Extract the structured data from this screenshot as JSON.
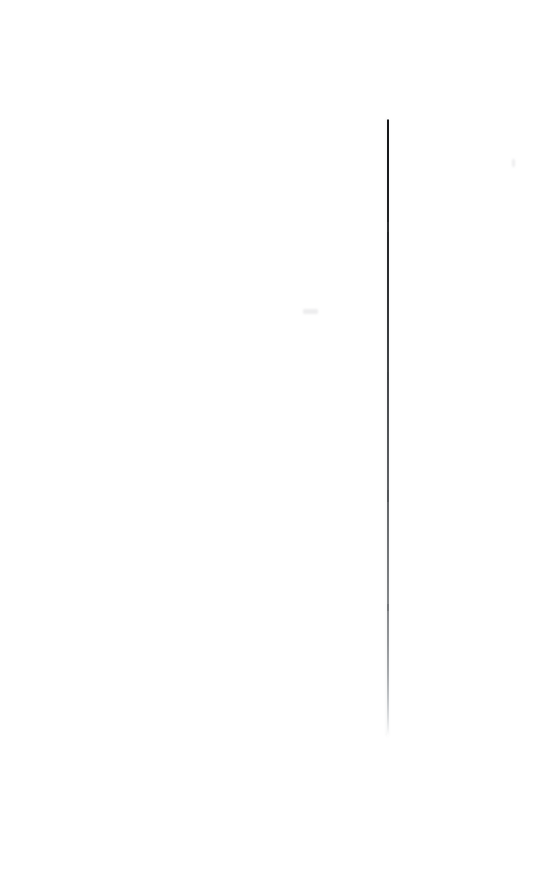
{
  "page": {
    "kind": "blank-scanned-page",
    "width_px": 546,
    "height_px": 884,
    "background_color": "#ffffff",
    "text_content": "",
    "visible_text_count": 0
  },
  "artifacts": {
    "vertical_streak": {
      "name": "vertical-scan-line",
      "x_px": 388,
      "top_px": 118,
      "bottom_px": 736,
      "length_px": 618,
      "width_px": 1.6,
      "color_top": "#16181a",
      "color_mid": "#56595c",
      "color_bottom": "#dcdee0",
      "orientation": "vertical",
      "fade_direction": "top-dark-to-bottom-light"
    },
    "density_nodes": [
      {
        "name": "node-upper",
        "y_px": 222,
        "height_px": 10
      },
      {
        "name": "node-mid",
        "y_px": 372,
        "height_px": 8
      },
      {
        "name": "node-lower",
        "y_px": 490,
        "height_px": 12
      },
      {
        "name": "node-bottom",
        "y_px": 604,
        "height_px": 7
      }
    ],
    "specks": [
      {
        "name": "speck-left",
        "x_px": 303,
        "y_px": 309,
        "width_px": 15,
        "height_px": 5,
        "color": "#ededee"
      },
      {
        "name": "speck-right",
        "x_px": 512,
        "y_px": 159,
        "width_px": 2.5,
        "height_px": 8,
        "color": "#ededee"
      }
    ]
  }
}
